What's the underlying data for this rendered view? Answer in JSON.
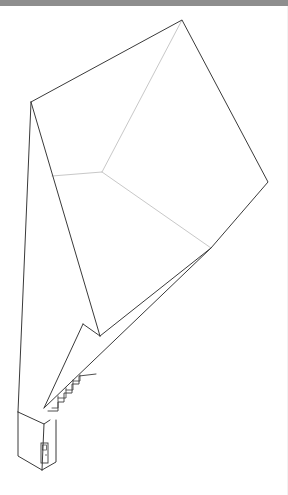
{
  "colors": {
    "top_bar": "#8e8e8e",
    "outline": "#3a3a3a",
    "faint": "#c8c8c8",
    "background": "#ffffff"
  },
  "drawing": {
    "outline": [
      [
        31,
        102
      ],
      [
        182,
        20
      ],
      [
        268,
        182
      ],
      [
        211,
        248
      ],
      [
        100,
        336
      ],
      [
        68,
        352
      ],
      [
        44,
        364
      ],
      [
        18,
        412
      ],
      [
        18,
        456
      ],
      [
        58,
        476
      ],
      [
        60,
        430
      ],
      [
        31,
        102
      ]
    ],
    "left_inner_edge": [
      [
        31,
        102
      ],
      [
        40,
        366
      ]
    ],
    "left_outer_edge": [
      [
        31,
        102
      ],
      [
        18,
        412
      ]
    ],
    "faint_lines": [
      [
        [
          182,
          20
        ],
        [
          102,
          172
        ]
      ],
      [
        [
          102,
          172
        ],
        [
          52,
          176
        ]
      ],
      [
        [
          102,
          172
        ],
        [
          211,
          248
        ]
      ]
    ],
    "inner_triangle": [
      [
        83,
        324
      ],
      [
        100,
        336
      ],
      [
        44,
        408
      ]
    ],
    "stairs": [
      [
        [
          48,
          411
        ],
        [
          58,
          411
        ],
        [
          58,
          402
        ],
        [
          64,
          402
        ],
        [
          64,
          393
        ],
        [
          72,
          393
        ],
        [
          72,
          384
        ],
        [
          79,
          384
        ],
        [
          79,
          376
        ],
        [
          96,
          374
        ]
      ]
    ],
    "stair_boxes": [
      [
        [
          52,
          408
        ],
        [
          58,
          408
        ],
        [
          58,
          396
        ]
      ],
      [
        [
          58,
          398
        ],
        [
          66,
          398
        ],
        [
          66,
          388
        ]
      ],
      [
        [
          66,
          390
        ],
        [
          73,
          390
        ],
        [
          73,
          380
        ]
      ],
      [
        [
          73,
          381
        ],
        [
          80,
          381
        ],
        [
          80,
          375
        ]
      ]
    ],
    "box_front": [
      [
        18,
        412
      ],
      [
        42,
        430
      ],
      [
        60,
        416
      ]
    ],
    "box_vertical": [
      [
        42,
        430
      ],
      [
        40,
        476
      ]
    ],
    "door": {
      "x": 41,
      "y": 443,
      "w": 7,
      "h": 20
    },
    "door_knob": {
      "x": 46,
      "y": 455
    }
  }
}
